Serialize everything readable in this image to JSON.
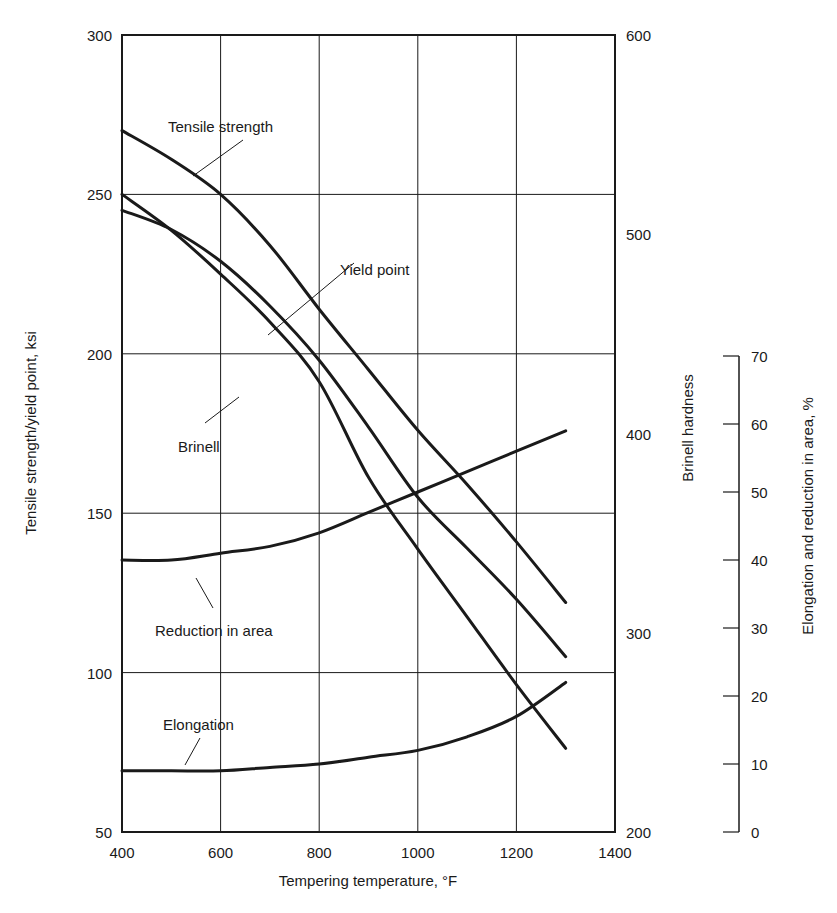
{
  "chart_data": {
    "type": "line",
    "title": "",
    "xlabel": "Tempering temperature, °F",
    "ylabel": "Tensile strength/yield point, ksi",
    "y2label": "Brinell hardness",
    "y3label": "Elongation and reduction in area, %",
    "xlim": [
      400,
      1400
    ],
    "ylim": [
      50,
      300
    ],
    "y2lim": [
      200,
      600
    ],
    "y3lim": [
      0,
      70
    ],
    "grid": true,
    "x_ticks": [
      400,
      600,
      800,
      1000,
      1200,
      1400
    ],
    "y_ticks": [
      50,
      100,
      150,
      200,
      250,
      300
    ],
    "y2_ticks": [
      200,
      300,
      400,
      500,
      600
    ],
    "y3_ticks": [
      0,
      10,
      20,
      30,
      40,
      50,
      60,
      70
    ],
    "series": [
      {
        "name": "Tensile strength",
        "axis": "ksi",
        "x": [
          400,
          500,
          600,
          700,
          800,
          900,
          1000,
          1100,
          1200,
          1300
        ],
        "values": [
          270,
          261,
          250,
          234,
          214,
          195,
          176,
          159,
          141,
          122
        ]
      },
      {
        "name": "Yield point",
        "axis": "ksi",
        "x": [
          400,
          500,
          600,
          700,
          800,
          900,
          1000,
          1100,
          1200,
          1300
        ],
        "values": [
          245,
          239,
          229,
          215,
          198,
          177,
          155,
          139,
          123,
          105
        ]
      },
      {
        "name": "Brinell",
        "axis": "brinell",
        "x": [
          400,
          500,
          600,
          700,
          800,
          900,
          1000,
          1100,
          1200,
          1300
        ],
        "values": [
          520,
          502,
          480,
          456,
          426,
          378,
          342,
          308,
          274,
          242
        ]
      },
      {
        "name": "Reduction in area",
        "axis": "percent",
        "x": [
          400,
          500,
          600,
          700,
          800,
          900,
          1000,
          1100,
          1200,
          1300
        ],
        "values": [
          40,
          40,
          41,
          42,
          44,
          47,
          50,
          53,
          56,
          59
        ]
      },
      {
        "name": "Elongation",
        "axis": "percent",
        "x": [
          400,
          500,
          600,
          700,
          800,
          900,
          1000,
          1100,
          1200,
          1300
        ],
        "values": [
          9,
          9,
          9,
          9.5,
          10,
          11,
          12,
          14,
          17,
          22
        ]
      }
    ],
    "annotations": [
      "Tensile strength",
      "Yield point",
      "Brinell",
      "Reduction in area",
      "Elongation"
    ]
  }
}
